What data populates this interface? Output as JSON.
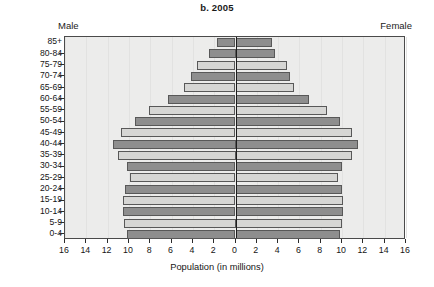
{
  "chart_data": {
    "type": "bar",
    "subtype": "population-pyramid",
    "title": "b. 2005",
    "xlabel": "Population (in millions)",
    "ylabel": "",
    "left_series_name": "Male",
    "right_series_name": "Female",
    "xlim": [
      -16,
      16
    ],
    "xticks": [
      16,
      14,
      12,
      10,
      8,
      6,
      4,
      2,
      0,
      2,
      4,
      6,
      8,
      10,
      12,
      14,
      16
    ],
    "grid": false,
    "legend": "none",
    "categories": [
      "0-4",
      "5-9",
      "10-14",
      "15-19",
      "20-24",
      "25-29",
      "30-34",
      "35-39",
      "40-44",
      "45-49",
      "50-54",
      "55-59",
      "60-64",
      "65-69",
      "70-74",
      "75-79",
      "80-84",
      "85+"
    ],
    "series": [
      {
        "name": "Male",
        "values": [
          10.2,
          10.5,
          10.6,
          10.6,
          10.4,
          9.9,
          10.2,
          11.0,
          11.5,
          10.7,
          9.4,
          8.1,
          6.3,
          4.8,
          4.2,
          3.6,
          2.5,
          1.7
        ]
      },
      {
        "name": "Female",
        "values": [
          9.8,
          10.0,
          10.1,
          10.1,
          10.0,
          9.6,
          10.0,
          10.9,
          11.5,
          10.9,
          9.8,
          8.6,
          6.9,
          5.5,
          5.1,
          4.8,
          3.7,
          3.4
        ]
      }
    ],
    "bar_shading": [
      "dark",
      "light",
      "dark",
      "light",
      "dark",
      "light",
      "dark",
      "light",
      "dark",
      "light",
      "dark",
      "light",
      "dark",
      "light",
      "dark",
      "light",
      "dark",
      "dark"
    ],
    "colors": {
      "bar_dark": "#8e8e8e",
      "bar_light": "#d6d6d4",
      "bar_border": "#585858",
      "plot_background": "#ececeb",
      "plot_border": "#4a4a4a",
      "center_axis": "#1d1d1d",
      "text": "#151515"
    }
  }
}
